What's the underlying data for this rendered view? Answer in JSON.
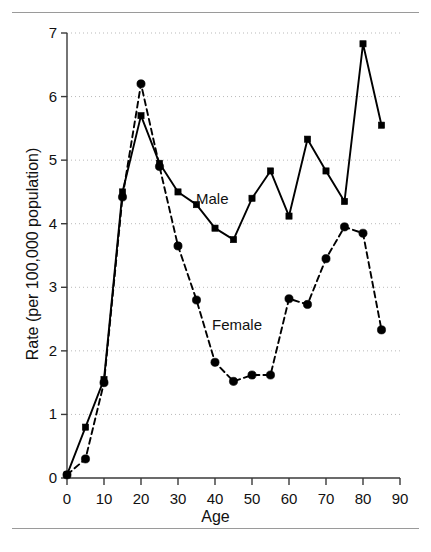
{
  "chart_data": {
    "type": "line",
    "title": "",
    "xlabel": "Age",
    "ylabel": "Rate (per 100,000 population)",
    "xlim": [
      0,
      90
    ],
    "ylim": [
      0,
      7
    ],
    "xticks": [
      0,
      10,
      20,
      30,
      40,
      50,
      60,
      70,
      80,
      90
    ],
    "yticks": [
      0,
      1,
      2,
      3,
      4,
      5,
      6,
      7
    ],
    "grid": "horizontal-dotted",
    "legend_position": "inline-annotation",
    "series": [
      {
        "name": "Male",
        "marker": "square",
        "linestyle": "solid",
        "color": "#000000",
        "x": [
          0,
          5,
          10,
          15,
          20,
          25,
          30,
          35,
          40,
          45,
          50,
          55,
          60,
          65,
          70,
          75,
          80,
          85
        ],
        "values": [
          0.05,
          0.8,
          1.55,
          4.5,
          5.7,
          4.95,
          4.5,
          4.3,
          3.93,
          3.75,
          4.4,
          4.83,
          4.12,
          5.33,
          4.83,
          4.35,
          6.83,
          5.55
        ]
      },
      {
        "name": "Female",
        "marker": "circle",
        "linestyle": "dashed",
        "color": "#000000",
        "x": [
          0,
          5,
          10,
          15,
          20,
          25,
          30,
          35,
          40,
          45,
          50,
          55,
          60,
          65,
          70,
          75,
          80,
          85
        ],
        "values": [
          0.05,
          0.3,
          1.5,
          4.42,
          6.2,
          4.9,
          3.65,
          2.8,
          1.82,
          1.52,
          1.62,
          1.62,
          2.82,
          2.73,
          3.45,
          3.95,
          3.85,
          2.33
        ]
      }
    ],
    "annotations": [
      {
        "text": "Male",
        "x": 33,
        "y": 4.45
      },
      {
        "text": "Female",
        "x": 37,
        "y": 2.45
      }
    ]
  },
  "axis": {
    "x_title": "Age",
    "y_title": "Rate (per 100,000 population)",
    "x_tick_labels": [
      "0",
      "10",
      "20",
      "30",
      "40",
      "50",
      "60",
      "70",
      "80",
      "90"
    ],
    "y_tick_labels": [
      "0",
      "1",
      "2",
      "3",
      "4",
      "5",
      "6",
      "7"
    ]
  },
  "labels": {
    "male": "Male",
    "female": "Female"
  },
  "caption": ""
}
